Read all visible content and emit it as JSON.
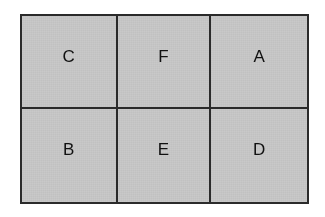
{
  "figure": {
    "kind": "labelled-grid-diagram",
    "rows": 2,
    "columns": 3,
    "fill_color": "#c9c9c9",
    "border_color": "#2b2b2b",
    "label_color": "#111111",
    "background_color": "#ffffff",
    "cells": [
      {
        "label": "C",
        "row": 1,
        "column": 1
      },
      {
        "label": "F",
        "row": 1,
        "column": 2
      },
      {
        "label": "A",
        "row": 1,
        "column": 3
      },
      {
        "label": "B",
        "row": 2,
        "column": 1
      },
      {
        "label": "E",
        "row": 2,
        "column": 2
      },
      {
        "label": "D",
        "row": 2,
        "column": 3
      }
    ]
  }
}
